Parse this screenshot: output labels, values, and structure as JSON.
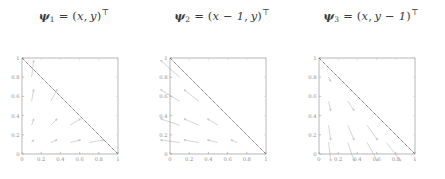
{
  "figure": {
    "caption": "",
    "background": "#ffffff",
    "panel_count": 3
  },
  "panels": [
    {
      "id": "psi-1",
      "formula": {
        "symbol": "ψ",
        "subscript": "1",
        "equals": "=",
        "open": "(",
        "x_term": "x",
        "comma": ",",
        "y_term": "y",
        "close": ")",
        "transpose": "⊤",
        "plain": "ψ1 = (x, y)⊤"
      }
    },
    {
      "id": "psi-2",
      "formula": {
        "symbol": "ψ",
        "subscript": "2",
        "equals": "=",
        "open": "(",
        "x_term": "x − 1",
        "comma": ",",
        "y_term": "y",
        "close": ")",
        "transpose": "⊤",
        "plain": "ψ2 = (x − 1, y)⊤"
      }
    },
    {
      "id": "psi-3",
      "formula": {
        "symbol": "ψ",
        "subscript": "3",
        "equals": "=",
        "open": "(",
        "x_term": "x",
        "comma": ",",
        "y_term": "y − 1",
        "close": ")",
        "transpose": "⊤",
        "plain": "ψ3 = (x, y − 1)⊤"
      }
    }
  ],
  "chart_data": [
    {
      "type": "scatter",
      "subtype": "quiver",
      "title": "ψ1 = (x, y)⊤",
      "xlabel": "",
      "ylabel": "",
      "xlim": [
        0,
        1
      ],
      "ylim": [
        0,
        1
      ],
      "xticks": [
        0,
        0.2,
        0.4,
        0.6,
        0.8,
        1
      ],
      "xticklabels": [
        "0",
        "0.2",
        "0.4",
        "0.6",
        "0.8",
        "1"
      ],
      "yticks": [
        0,
        0.2,
        0.4,
        0.6,
        0.8,
        1
      ],
      "yticklabels": [
        "0",
        "0.2",
        "0.4",
        "0.6",
        "0.8",
        "1"
      ],
      "grid": false,
      "legend": null,
      "annotations": [
        {
          "kind": "line",
          "name": "hypotenuse",
          "x": [
            0,
            1
          ],
          "y": [
            1,
            0
          ],
          "style": "dotted",
          "color": "#555555"
        }
      ],
      "vector_field": {
        "formula": "(x, y)",
        "arrow_color": "#b9b9b9",
        "scale": 0.22,
        "origins": [
          [
            0.1,
            0.8
          ],
          [
            0.1,
            0.55
          ],
          [
            0.1,
            0.3
          ],
          [
            0.1,
            0.12
          ],
          [
            0.3,
            0.55
          ],
          [
            0.3,
            0.3
          ],
          [
            0.3,
            0.12
          ],
          [
            0.5,
            0.3
          ],
          [
            0.5,
            0.12
          ],
          [
            0.7,
            0.12
          ]
        ],
        "components": [
          [
            0.1,
            0.8
          ],
          [
            0.1,
            0.55
          ],
          [
            0.1,
            0.3
          ],
          [
            0.1,
            0.12
          ],
          [
            0.3,
            0.55
          ],
          [
            0.3,
            0.3
          ],
          [
            0.3,
            0.12
          ],
          [
            0.5,
            0.3
          ],
          [
            0.5,
            0.12
          ],
          [
            0.7,
            0.12
          ]
        ]
      }
    },
    {
      "type": "scatter",
      "subtype": "quiver",
      "title": "ψ2 = (x − 1, y)⊤",
      "xlabel": "",
      "ylabel": "",
      "xlim": [
        0,
        1
      ],
      "ylim": [
        0,
        1
      ],
      "xticks": [
        0,
        0.2,
        0.4,
        0.6,
        0.8,
        1
      ],
      "xticklabels": [
        "0",
        "0.2",
        "0.4",
        "0.6",
        "0.8",
        "1"
      ],
      "yticks": [
        0,
        0.2,
        0.4,
        0.6,
        0.8,
        1
      ],
      "yticklabels": [
        "0",
        "0.2",
        "0.4",
        "0.6",
        "0.8",
        "1"
      ],
      "grid": false,
      "legend": null,
      "annotations": [
        {
          "kind": "line",
          "name": "hypotenuse",
          "x": [
            0,
            1
          ],
          "y": [
            1,
            0
          ],
          "style": "dotted",
          "color": "#555555"
        }
      ],
      "vector_field": {
        "formula": "(x - 1, y)",
        "arrow_color": "#b9b9b9",
        "scale": 0.22,
        "origins": [
          [
            0.1,
            0.8
          ],
          [
            0.1,
            0.55
          ],
          [
            0.1,
            0.3
          ],
          [
            0.1,
            0.12
          ],
          [
            0.3,
            0.55
          ],
          [
            0.3,
            0.3
          ],
          [
            0.3,
            0.12
          ],
          [
            0.5,
            0.3
          ],
          [
            0.5,
            0.12
          ],
          [
            0.7,
            0.12
          ]
        ],
        "components": [
          [
            -0.9,
            0.8
          ],
          [
            -0.9,
            0.55
          ],
          [
            -0.9,
            0.3
          ],
          [
            -0.9,
            0.12
          ],
          [
            -0.7,
            0.55
          ],
          [
            -0.7,
            0.3
          ],
          [
            -0.7,
            0.12
          ],
          [
            -0.5,
            0.3
          ],
          [
            -0.5,
            0.12
          ],
          [
            -0.3,
            0.12
          ]
        ]
      }
    },
    {
      "type": "scatter",
      "subtype": "quiver",
      "title": "ψ3 = (x, y − 1)⊤",
      "xlabel": "",
      "ylabel": "",
      "xlim": [
        0,
        1
      ],
      "ylim": [
        0,
        1
      ],
      "xticks": [
        0,
        0.2,
        0.4,
        0.6,
        0.8,
        1
      ],
      "xticklabels": [
        "0",
        "0.2",
        "0.4",
        "0.6",
        "0.8",
        "1"
      ],
      "yticks": [
        0,
        0.2,
        0.4,
        0.6,
        0.8,
        1
      ],
      "yticklabels": [
        "0",
        "0.2",
        "0.4",
        "0.6",
        "0.8",
        "1"
      ],
      "grid": false,
      "legend": null,
      "annotations": [
        {
          "kind": "line",
          "name": "hypotenuse",
          "x": [
            0,
            1
          ],
          "y": [
            1,
            0
          ],
          "style": "dotted",
          "color": "#555555"
        }
      ],
      "vector_field": {
        "formula": "(x, y - 1)",
        "arrow_color": "#b9b9b9",
        "scale": 0.22,
        "origins": [
          [
            0.1,
            0.8
          ],
          [
            0.1,
            0.55
          ],
          [
            0.1,
            0.3
          ],
          [
            0.1,
            0.12
          ],
          [
            0.3,
            0.55
          ],
          [
            0.3,
            0.3
          ],
          [
            0.3,
            0.12
          ],
          [
            0.5,
            0.3
          ],
          [
            0.5,
            0.12
          ],
          [
            0.7,
            0.12
          ]
        ],
        "components": [
          [
            0.1,
            -0.2
          ],
          [
            0.1,
            -0.45
          ],
          [
            0.1,
            -0.7
          ],
          [
            0.1,
            -0.88
          ],
          [
            0.3,
            -0.45
          ],
          [
            0.3,
            -0.7
          ],
          [
            0.3,
            -0.88
          ],
          [
            0.5,
            -0.7
          ],
          [
            0.5,
            -0.88
          ],
          [
            0.7,
            -0.88
          ]
        ]
      }
    }
  ]
}
